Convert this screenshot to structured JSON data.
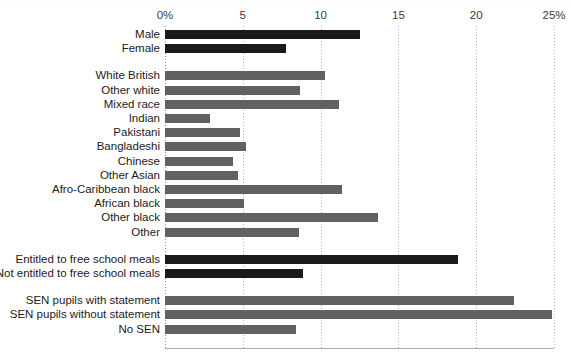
{
  "chart_data": {
    "type": "bar",
    "orientation": "horizontal",
    "title": "",
    "xlabel": "",
    "ylabel": "",
    "xlim": [
      0,
      25
    ],
    "grid": true,
    "legend": "none",
    "tick_labels": [
      "0%",
      "5",
      "10",
      "15",
      "20",
      "25%"
    ],
    "tick_values": [
      0,
      5,
      10,
      15,
      20,
      25
    ],
    "colors": {
      "dark_bar": "#1a1a1a",
      "gray_bar": "#616161",
      "gridline": "#b9b9b9",
      "text": "#1b1b1b"
    },
    "groups": [
      {
        "name": "gender",
        "color": "dark_bar",
        "categories": [
          "Male",
          "Female"
        ],
        "values": [
          12.5,
          7.8
        ]
      },
      {
        "name": "ethnicity",
        "color": "gray_bar",
        "categories": [
          "White British",
          "Other white",
          "Mixed race",
          "Indian",
          "Pakistani",
          "Bangladeshi",
          "Chinese",
          "Other Asian",
          "Afro-Caribbean black",
          "African black",
          "Other black",
          "Other"
        ],
        "values": [
          10.3,
          8.7,
          11.2,
          2.9,
          4.8,
          5.2,
          4.4,
          4.7,
          11.4,
          5.1,
          13.7,
          8.6
        ]
      },
      {
        "name": "free-school-meals",
        "color": "dark_bar",
        "categories": [
          "Entitled to free school meals",
          "Not entitled to free school meals"
        ],
        "values": [
          18.8,
          8.9
        ]
      },
      {
        "name": "special-educational-needs",
        "color": "gray_bar",
        "categories": [
          "SEN pupils with statement",
          "SEN pupils without statement",
          "No SEN"
        ],
        "values": [
          22.4,
          24.9,
          8.4
        ]
      }
    ]
  }
}
